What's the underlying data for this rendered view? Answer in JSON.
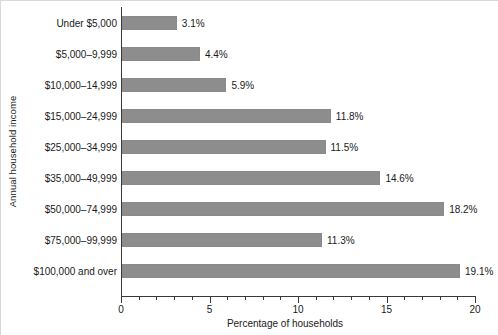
{
  "chart_data": {
    "type": "bar",
    "orientation": "horizontal",
    "title": "",
    "xlabel": "Percentage of households",
    "ylabel": "Annual household income",
    "categories": [
      "Under $5,000",
      "$5,000–9,999",
      "$10,000–14,999",
      "$15,000–24,999",
      "$25,000–34,999",
      "$35,000–49,999",
      "$50,000–74,999",
      "$75,000–99,999",
      "$100,000 and over"
    ],
    "values": [
      3.1,
      4.4,
      5.9,
      11.8,
      11.5,
      14.6,
      18.2,
      11.3,
      19.1
    ],
    "value_labels": [
      "3.1%",
      "4.4%",
      "5.9%",
      "11.8%",
      "11.5%",
      "14.6%",
      "18.2%",
      "11.3%",
      "19.1%"
    ],
    "xlim": [
      0,
      20
    ],
    "xticks": [
      0,
      5,
      10,
      15,
      20
    ],
    "xtick_labels": [
      "0",
      "5",
      "10",
      "15",
      "20"
    ],
    "minor_tick_step": 1,
    "grid": false,
    "legend": null,
    "bar_color": "#8d8d8d",
    "axis_color": "#3a3a3a",
    "text_color": "#1a1a1a",
    "background_color": "#ffffff"
  }
}
